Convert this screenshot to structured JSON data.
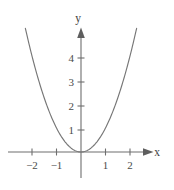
{
  "chart_data": {
    "type": "line",
    "title": "",
    "subtitle": "",
    "xlabel": "x",
    "ylabel": "y",
    "function": "y = x^2",
    "grid": false,
    "legend": null,
    "xlim": [
      -2.9,
      2.9
    ],
    "ylim": [
      -1.1,
      5.4
    ],
    "x_ticks": [
      -2,
      -1,
      1,
      2
    ],
    "x_tick_labels": [
      "−2",
      "−1",
      "1",
      "2"
    ],
    "y_ticks": [
      1,
      2,
      3,
      4
    ],
    "y_tick_labels": [
      "1",
      "2",
      "3",
      "4"
    ],
    "origin_label": "",
    "series": [
      {
        "name": "y = x^2",
        "x": [
          -2.27,
          -2.0,
          -1.75,
          -1.5,
          -1.25,
          -1.0,
          -0.75,
          -0.5,
          -0.25,
          0,
          0.25,
          0.5,
          0.75,
          1.0,
          1.25,
          1.5,
          1.75,
          2.0,
          2.27
        ],
        "values": [
          5.15,
          4.0,
          3.06,
          2.25,
          1.56,
          1.0,
          0.56,
          0.25,
          0.06,
          0,
          0.06,
          0.25,
          0.56,
          1.0,
          1.56,
          2.25,
          3.06,
          4.0,
          5.15
        ]
      }
    ]
  },
  "axes": {
    "x_axis_name": "x-axis",
    "y_axis_name": "y-axis",
    "x_label_text": "x",
    "y_label_text": "y"
  },
  "colors": {
    "background": "#ffffff",
    "axis": "#6e6e6e",
    "curve": "#767676",
    "tick_text": "#4a4a4a",
    "axis_label_text": "#3f3f3f"
  }
}
